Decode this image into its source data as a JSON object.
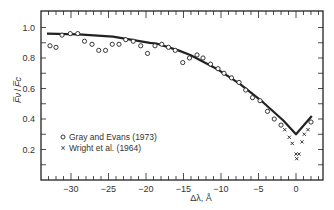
{
  "chart_data": {
    "type": "scatter",
    "title": "",
    "xlabel": "Δλ, Å",
    "ylabel": "F̅ν / F̅c",
    "xlim": [
      -34,
      3.6
    ],
    "ylim": [
      0.0,
      1.1
    ],
    "x_ticks_major": [
      -30,
      -25,
      -20,
      -15,
      -10,
      -5,
      0
    ],
    "x_tick_labels": [
      "−30",
      "−25",
      "−20",
      "−15",
      "−10",
      "−5",
      "0"
    ],
    "x_minor_step": 1,
    "y_ticks_major": [
      0.2,
      0.4,
      0.6,
      0.8,
      1.0
    ],
    "y_tick_labels": [
      "0.2",
      "0.4",
      "0.6",
      "0.8",
      "1.0"
    ],
    "y_minor_step": 0.1,
    "grid": false,
    "legend_position": "lower-left",
    "series": [
      {
        "name": "Gray and Evans (1973)",
        "marker": "circle",
        "legend_symbol": "o",
        "points": [
          [
            -32.8,
            0.88
          ],
          [
            -32.0,
            0.87
          ],
          [
            -31.2,
            0.95
          ],
          [
            -30.1,
            0.96
          ],
          [
            -29.1,
            0.96
          ],
          [
            -28.2,
            0.91
          ],
          [
            -27.2,
            0.89
          ],
          [
            -26.3,
            0.85
          ],
          [
            -25.4,
            0.85
          ],
          [
            -24.5,
            0.89
          ],
          [
            -23.6,
            0.89
          ],
          [
            -22.7,
            0.92
          ],
          [
            -21.7,
            0.91
          ],
          [
            -20.7,
            0.88
          ],
          [
            -19.8,
            0.83
          ],
          [
            -18.8,
            0.88
          ],
          [
            -17.9,
            0.89
          ],
          [
            -17.0,
            0.87
          ],
          [
            -16.1,
            0.85
          ],
          [
            -15.1,
            0.77
          ],
          [
            -14.2,
            0.8
          ],
          [
            -13.2,
            0.82
          ],
          [
            -12.4,
            0.8
          ],
          [
            -11.4,
            0.76
          ],
          [
            -10.4,
            0.73
          ],
          [
            -9.6,
            0.7
          ],
          [
            -8.6,
            0.67
          ],
          [
            -7.6,
            0.64
          ],
          [
            -6.7,
            0.59
          ],
          [
            -5.8,
            0.54
          ],
          [
            -4.8,
            0.52
          ],
          [
            -3.8,
            0.45
          ],
          [
            -2.9,
            0.4
          ],
          [
            -2.0,
            0.36
          ],
          [
            2.0,
            0.38
          ]
        ]
      },
      {
        "name": "Wright et al. (1964)",
        "marker": "cross",
        "legend_symbol": "×",
        "points": [
          [
            -1.5,
            0.33
          ],
          [
            -0.9,
            0.28
          ],
          [
            -0.5,
            0.24
          ],
          [
            0.0,
            0.17
          ],
          [
            0.4,
            0.17
          ],
          [
            0.1,
            0.14
          ],
          [
            0.8,
            0.25
          ],
          [
            1.1,
            0.3
          ],
          [
            1.6,
            0.33
          ]
        ]
      },
      {
        "name": "model curve",
        "marker": "line",
        "points": [
          [
            -33.2,
            0.96
          ],
          [
            -29.0,
            0.955
          ],
          [
            -24.4,
            0.94
          ],
          [
            -19.5,
            0.9
          ],
          [
            -18.6,
            0.895
          ],
          [
            -15.7,
            0.85
          ],
          [
            -14.1,
            0.82
          ],
          [
            -10.6,
            0.73
          ],
          [
            -7.5,
            0.63
          ],
          [
            -4.4,
            0.51
          ],
          [
            -1.7,
            0.39
          ],
          [
            0.0,
            0.3
          ],
          [
            2.1,
            0.42
          ]
        ]
      }
    ]
  },
  "legend": {
    "items": [
      {
        "symbol": "o",
        "label": "Gray and Evans (1973)"
      },
      {
        "symbol": "×",
        "label": "Wright et al. (1964)"
      }
    ]
  },
  "axes": {
    "x_title": "Δλ, Å",
    "y_title_num": "F̅ν",
    "y_title_den": "F̅c"
  },
  "colors": {
    "ink": "#222222",
    "background": "#ffffff"
  }
}
